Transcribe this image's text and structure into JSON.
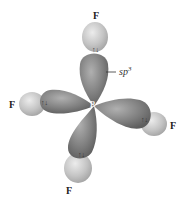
{
  "diagram": {
    "central_atom": "B",
    "ligands": [
      {
        "label": "F",
        "position": "top"
      },
      {
        "label": "F",
        "position": "left"
      },
      {
        "label": "F",
        "position": "right"
      },
      {
        "label": "F",
        "position": "bottom"
      }
    ],
    "hybrid_label": "sp",
    "hybrid_superscript": "3",
    "electron_pair_symbol": "↑↓",
    "colors": {
      "lobe": "#7a7a7a",
      "lobe_highlight": "#a8a8a8",
      "fluorine_orbital": "#c4c4c4",
      "fluorine_highlight": "#e6e6e6",
      "background": "#ffffff"
    }
  }
}
